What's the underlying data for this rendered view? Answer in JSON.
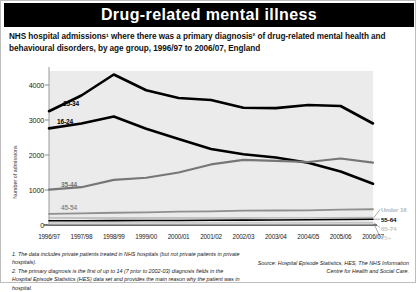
{
  "header": {
    "title": "Drug-related mental illness",
    "subtitle": "NHS hospital admissions¹ where there was a primary diagnosis² of drug-related mental health and behavioural disorders, by age group, 1996/97 to 2006/07, England"
  },
  "footnotes": [
    "1. The data includes private patients treated in NHS hospitals (but not private patients in private hospitals).",
    "2. The primary diagnosis is the first of up to 14 (7 prior to 2002-03) diagnosis fields in the Hospital Episode Statistics (HES) data set and provides the main reason why the patient was in hospital."
  ],
  "source": "Source: Hospital Episode Statistics, HES, The NHS Information Centre for Health and Social Care.",
  "chart_data": {
    "type": "line",
    "title": "Drug-related mental illness",
    "xlabel": "",
    "ylabel": "Number of admissions",
    "ylim": [
      0,
      4400
    ],
    "yticks": [
      0,
      1000,
      2000,
      3000,
      4000
    ],
    "ytick_labels": [
      "0",
      "1000",
      "2000",
      "3000",
      "4000"
    ],
    "grid": false,
    "legend": "inline-labels",
    "categories": [
      "1996/97",
      "1997/98",
      "1998/99",
      "1999/00",
      "2000/01",
      "2001/02",
      "2002/03",
      "2003/04",
      "2004/05",
      "2005/06",
      "2006/07"
    ],
    "series": [
      {
        "name": "25-34",
        "color": "#000000",
        "width": 2.6,
        "label_position": "inline-top-left",
        "values": [
          3250,
          3700,
          4300,
          3850,
          3630,
          3570,
          3350,
          3340,
          3430,
          3400,
          2900
        ]
      },
      {
        "name": "16-24",
        "color": "#000000",
        "width": 2.6,
        "label_position": "inline-left",
        "values": [
          2760,
          2900,
          3100,
          2750,
          2460,
          2170,
          2020,
          1930,
          1780,
          1530,
          1180
        ]
      },
      {
        "name": "35-44",
        "color": "#767676",
        "width": 2.2,
        "label_position": "inline-left",
        "values": [
          1010,
          1080,
          1290,
          1350,
          1500,
          1730,
          1860,
          1830,
          1800,
          1900,
          1780
        ]
      },
      {
        "name": "45-54",
        "color": "#8f8f8f",
        "width": 1.8,
        "label_position": "inline-left",
        "values": [
          320,
          330,
          350,
          360,
          380,
          390,
          410,
          415,
          420,
          440,
          450
        ]
      },
      {
        "name": "Under 16",
        "color": "#b5b5b5",
        "width": 1.4,
        "label_position": "right",
        "values": [
          205,
          200,
          200,
          200,
          200,
          200,
          200,
          205,
          205,
          210,
          215
        ]
      },
      {
        "name": "55-64",
        "color": "#000000",
        "width": 1.6,
        "label_position": "right",
        "values": [
          120,
          122,
          125,
          128,
          130,
          135,
          140,
          145,
          150,
          158,
          165
        ]
      },
      {
        "name": "65-74",
        "color": "#c4c4c4",
        "width": 1.2,
        "label_position": "right",
        "values": [
          60,
          60,
          62,
          62,
          62,
          63,
          64,
          64,
          65,
          66,
          68
        ]
      },
      {
        "name": "75+",
        "color": "#d0d0d0",
        "width": 1.2,
        "label_position": "right",
        "values": [
          28,
          28,
          29,
          29,
          30,
          30,
          31,
          31,
          32,
          32,
          33
        ]
      }
    ]
  }
}
